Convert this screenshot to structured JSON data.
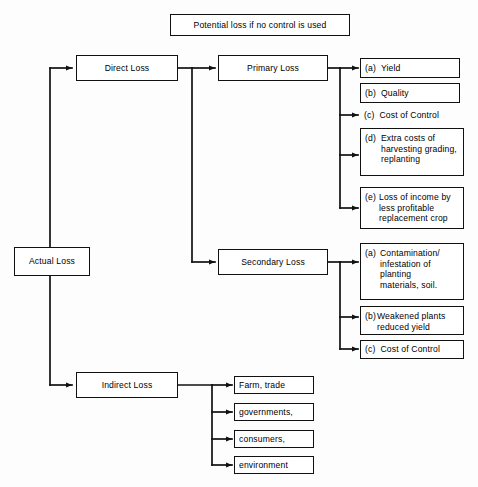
{
  "diagram": {
    "title": "Potential loss if no control is used",
    "root": {
      "label": "Actual Loss"
    },
    "branches": [
      {
        "label": "Direct Loss"
      },
      {
        "label": "Indirect Loss"
      }
    ],
    "direct_children": [
      {
        "label": "Primary Loss"
      },
      {
        "label": "Secondary Loss"
      }
    ],
    "primary_items": [
      {
        "key": "(a)",
        "text": "Yield",
        "boxed": true,
        "arrow": true
      },
      {
        "key": "(b)",
        "text": "Quality",
        "boxed": true,
        "arrow": false
      },
      {
        "key": "(c)",
        "text": "Cost of Control",
        "boxed": false,
        "arrow": true
      },
      {
        "key": "(d)",
        "text": "Extra costs of\nharvesting grading,\nreplanting",
        "boxed": true,
        "arrow": true
      },
      {
        "key": "(e)",
        "text": "Loss of income by\nless profitable\nreplacement crop",
        "boxed": true,
        "arrow": true
      }
    ],
    "secondary_items": [
      {
        "key": "(a)",
        "text": "Contamination/\ninfestation of\nplanting\nmaterials, soil.",
        "boxed": true,
        "arrow": true
      },
      {
        "key": "(b)",
        "text": "Weakened plants\nreduced yield",
        "boxed": true,
        "arrow": true
      },
      {
        "key": "(c)",
        "text": "Cost of Control",
        "boxed": true,
        "arrow": true
      }
    ],
    "indirect_items": [
      {
        "label": "Farm, trade"
      },
      {
        "label": "governments,"
      },
      {
        "label": "consumers,"
      },
      {
        "label": "environment"
      }
    ],
    "colors": {
      "line": "#111111",
      "box_border": "#111111",
      "background": "#fdfdfd",
      "text": "#000000"
    }
  }
}
